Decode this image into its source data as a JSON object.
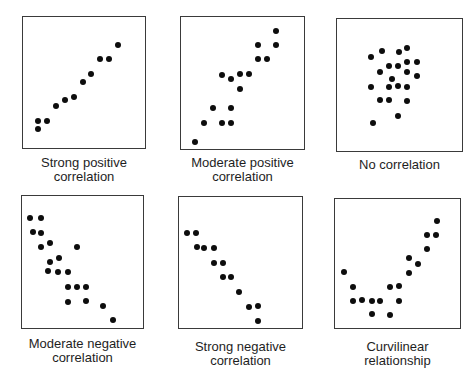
{
  "chart_data": [
    {
      "type": "scatter",
      "title": "Strong positive correlation",
      "caption_lines": [
        "Strong positive",
        "correlation"
      ],
      "box": {
        "x": 22,
        "y": 16,
        "w": 124,
        "h": 133
      },
      "points": [
        [
          16,
          113
        ],
        [
          16,
          105
        ],
        [
          25,
          105
        ],
        [
          34,
          90
        ],
        [
          43,
          84
        ],
        [
          52,
          81
        ],
        [
          61,
          66
        ],
        [
          69,
          58
        ],
        [
          78,
          43
        ],
        [
          87,
          43
        ],
        [
          96,
          29
        ]
      ]
    },
    {
      "type": "scatter",
      "title": "Moderate positive correlation",
      "caption_lines": [
        "Moderate positive",
        "correlation"
      ],
      "box": {
        "x": 180,
        "y": 16,
        "w": 125,
        "h": 134
      },
      "points": [
        [
          15,
          126
        ],
        [
          24,
          107
        ],
        [
          42,
          107
        ],
        [
          51,
          107
        ],
        [
          33,
          92
        ],
        [
          51,
          92
        ],
        [
          60,
          73
        ],
        [
          42,
          59
        ],
        [
          51,
          63
        ],
        [
          60,
          58
        ],
        [
          69,
          58
        ],
        [
          78,
          43
        ],
        [
          87,
          43
        ],
        [
          78,
          29
        ],
        [
          96,
          29
        ],
        [
          96,
          15
        ]
      ]
    },
    {
      "type": "scatter",
      "title": "No correlation",
      "caption_lines": [
        "No correlation"
      ],
      "box": {
        "x": 336,
        "y": 18,
        "w": 127,
        "h": 134
      },
      "points": [
        [
          35,
          39
        ],
        [
          46,
          33
        ],
        [
          63,
          34
        ],
        [
          71,
          30
        ],
        [
          53,
          48
        ],
        [
          62,
          48
        ],
        [
          71,
          44
        ],
        [
          81,
          44
        ],
        [
          44,
          54
        ],
        [
          71,
          54
        ],
        [
          81,
          58
        ],
        [
          56,
          61
        ],
        [
          35,
          69
        ],
        [
          53,
          69
        ],
        [
          62,
          68
        ],
        [
          71,
          69
        ],
        [
          44,
          82
        ],
        [
          53,
          82
        ],
        [
          71,
          83
        ],
        [
          62,
          98
        ],
        [
          37,
          105
        ]
      ]
    },
    {
      "type": "scatter",
      "title": "Moderate negative correlation",
      "caption_lines": [
        "Moderate negative",
        "correlation"
      ],
      "box": {
        "x": 21,
        "y": 195,
        "w": 123,
        "h": 134
      },
      "points": [
        [
          9,
          23
        ],
        [
          20,
          23
        ],
        [
          12,
          37
        ],
        [
          20,
          38
        ],
        [
          29,
          48
        ],
        [
          20,
          52
        ],
        [
          56,
          52
        ],
        [
          38,
          63
        ],
        [
          29,
          67
        ],
        [
          27,
          76
        ],
        [
          37,
          77
        ],
        [
          47,
          77
        ],
        [
          47,
          92
        ],
        [
          56,
          92
        ],
        [
          65,
          92
        ],
        [
          47,
          107
        ],
        [
          65,
          106
        ],
        [
          82,
          111
        ],
        [
          92,
          125
        ]
      ]
    },
    {
      "type": "scatter",
      "title": "Strong negative correlation",
      "caption_lines": [
        "Strong negative",
        "correlation"
      ],
      "box": {
        "x": 178,
        "y": 196,
        "w": 125,
        "h": 133
      },
      "points": [
        [
          9,
          37
        ],
        [
          18,
          37
        ],
        [
          19,
          51
        ],
        [
          26,
          52
        ],
        [
          36,
          52
        ],
        [
          36,
          67
        ],
        [
          45,
          67
        ],
        [
          45,
          81
        ],
        [
          53,
          81
        ],
        [
          61,
          96
        ],
        [
          71,
          111
        ],
        [
          80,
          110
        ],
        [
          80,
          125
        ]
      ]
    },
    {
      "type": "scatter",
      "title": "Curvilinear relationship",
      "caption_lines": [
        "Curvilinear",
        "relationship"
      ],
      "box": {
        "x": 334,
        "y": 198,
        "w": 127,
        "h": 131
      },
      "points": [
        [
          10,
          74
        ],
        [
          19,
          89
        ],
        [
          19,
          103
        ],
        [
          28,
          102
        ],
        [
          38,
          103
        ],
        [
          46,
          103
        ],
        [
          38,
          116
        ],
        [
          56,
          117
        ],
        [
          56,
          89
        ],
        [
          65,
          88
        ],
        [
          65,
          103
        ],
        [
          75,
          75
        ],
        [
          75,
          60
        ],
        [
          84,
          66
        ],
        [
          93,
          51
        ],
        [
          93,
          37
        ],
        [
          102,
          37
        ],
        [
          103,
          23
        ]
      ]
    }
  ],
  "captions": {
    "p0": {
      "line1": "Strong positive",
      "line2": "correlation"
    },
    "p1": {
      "line1": "Moderate positive",
      "line2": "correlation"
    },
    "p2": {
      "line1": "No correlation"
    },
    "p3": {
      "line1": "Moderate negative",
      "line2": "correlation"
    },
    "p4": {
      "line1": "Strong negative",
      "line2": "correlation"
    },
    "p5": {
      "line1": "Curvilinear",
      "line2": "relationship"
    }
  },
  "colors": {
    "dot": "#0d0d0d",
    "border": "#3a3a3a",
    "text": "#1e1e1e",
    "background": "#ffffff"
  }
}
